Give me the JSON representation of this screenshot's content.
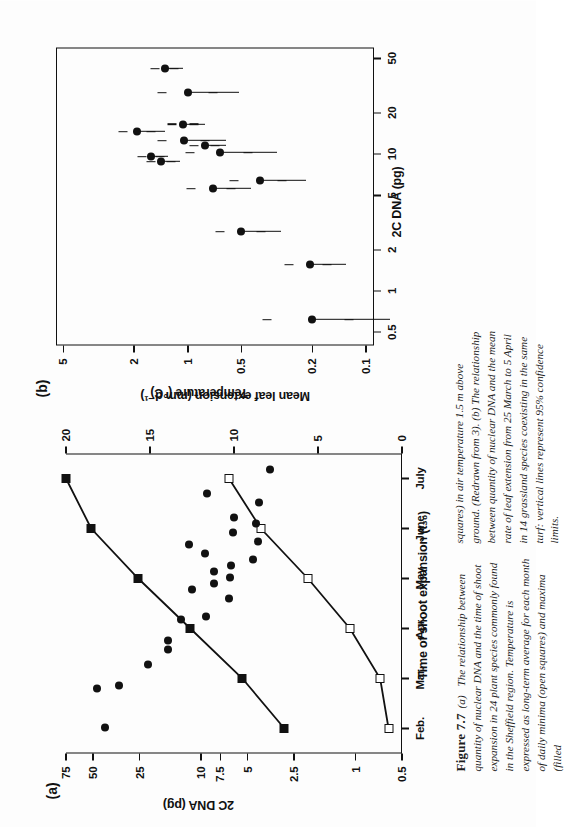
{
  "figure": {
    "label": "Figure 7.7",
    "caption_part_a_marker": "(a)",
    "caption_col1": "The relationship between quantity of nuclear DNA and the time of shoot expansion in 24 plant species commonly found in the Sheffield region. Temperature is expressed as long-term average for each month of daily minima (open squares) and maxima (filled",
    "caption_col2": "squares) in air temperature 1.5 m above ground. (Redrawn from 3). (b) The relationship between quantity of nuclear DNA and the mean rate of leaf extension from 25 March to 5 April in 14 grassland species coexisting in the same turf: vertical lines represent 95% confidence limits."
  },
  "panel_a": {
    "letter": "(a)",
    "left_axis_title": "2C DNA (pg)",
    "top_axis_title": "Temperature (°C)",
    "bottom_axis_title": "Time of shoot expansion (t₃₀)"
  },
  "panel_b": {
    "letter": "(b)",
    "left_axis_title": "Mean leaf extension (mm d⁻¹)",
    "bottom_axis_title": "2C DNA (pg)"
  },
  "chart_data": [
    {
      "id": "panel_a",
      "type": "scatter",
      "title": "(a) Nuclear DNA vs time of shoot expansion",
      "xlabel": "Time of shoot expansion (t30)",
      "ylabel": "2C DNA (pg)",
      "y2label": "Temperature (°C)",
      "yscale": "log",
      "ylim": [
        0.5,
        75
      ],
      "yticks": [
        75,
        50,
        25,
        10,
        7.5,
        5,
        2.5,
        1,
        0.5
      ],
      "ytick_labels": [
        "75",
        "50",
        "25",
        "10",
        "7.5",
        "5",
        "2.5",
        "1",
        "0.5"
      ],
      "y2lim": [
        0,
        20
      ],
      "y2ticks": [
        20,
        15,
        10,
        5,
        0
      ],
      "y2tick_labels": [
        "20",
        "15",
        "10",
        "5",
        "0"
      ],
      "xticks": [
        "Feb.",
        "Mar.",
        "Apr.",
        "May",
        "June",
        "July"
      ],
      "grid": false,
      "legend": "none",
      "series": [
        {
          "name": "maxima (filled squares)",
          "marker": "filled-square",
          "connected": true,
          "axis": "temperature",
          "points": [
            {
              "x": "Feb.",
              "temperature": 7.0
            },
            {
              "x": "Mar.",
              "temperature": 9.5
            },
            {
              "x": "Apr.",
              "temperature": 12.6
            },
            {
              "x": "May",
              "temperature": 15.7
            },
            {
              "x": "June",
              "temperature": 18.5
            },
            {
              "x": "July",
              "temperature": 20.0
            }
          ]
        },
        {
          "name": "minima (open squares)",
          "marker": "open-square",
          "connected": true,
          "axis": "temperature",
          "points": [
            {
              "x": "Feb.",
              "temperature": 0.8
            },
            {
              "x": "Mar.",
              "temperature": 1.3
            },
            {
              "x": "Apr.",
              "temperature": 3.1
            },
            {
              "x": "May",
              "temperature": 5.6
            },
            {
              "x": "June",
              "temperature": 8.4
            },
            {
              "x": "July",
              "temperature": 10.3
            }
          ]
        },
        {
          "name": "species 2C DNA",
          "marker": "filled-circle",
          "connected": false,
          "axis": "dna",
          "points": [
            {
              "x_frac": 0.085,
              "dna": 42
            },
            {
              "x_frac": 0.215,
              "dna": 47
            },
            {
              "x_frac": 0.225,
              "dna": 34
            },
            {
              "x_frac": 0.295,
              "dna": 22
            },
            {
              "x_frac": 0.345,
              "dna": 16.5
            },
            {
              "x_frac": 0.375,
              "dna": 16.5
            },
            {
              "x_frac": 0.445,
              "dna": 13.5
            },
            {
              "x_frac": 0.455,
              "dna": 9.3
            },
            {
              "x_frac": 0.515,
              "dna": 6.6
            },
            {
              "x_frac": 0.545,
              "dna": 11.5
            },
            {
              "x_frac": 0.565,
              "dna": 8.3
            },
            {
              "x_frac": 0.585,
              "dna": 6.5
            },
            {
              "x_frac": 0.605,
              "dna": 8.2
            },
            {
              "x_frac": 0.625,
              "dna": 6.4
            },
            {
              "x_frac": 0.645,
              "dna": 4.6
            },
            {
              "x_frac": 0.665,
              "dna": 9.4
            },
            {
              "x_frac": 0.695,
              "dna": 12.0
            },
            {
              "x_frac": 0.705,
              "dna": 4.3
            },
            {
              "x_frac": 0.735,
              "dna": 6.2
            },
            {
              "x_frac": 0.765,
              "dna": 4.4
            },
            {
              "x_frac": 0.785,
              "dna": 6.1
            },
            {
              "x_frac": 0.835,
              "dna": 4.2
            },
            {
              "x_frac": 0.865,
              "dna": 9.2
            },
            {
              "x_frac": 0.945,
              "dna": 3.6
            }
          ]
        }
      ]
    },
    {
      "id": "panel_b",
      "type": "scatter",
      "title": "(b) Mean leaf extension vs 2C DNA",
      "xlabel": "2C DNA (pg)",
      "ylabel": "Mean leaf extension (mm d-1)",
      "xscale": "log",
      "yscale": "log",
      "xlim": [
        0.4,
        60
      ],
      "xticks": [
        0.5,
        1,
        2,
        5,
        10,
        20,
        50
      ],
      "xtick_labels": [
        "0.5",
        "1",
        "2",
        "5",
        "10",
        "20",
        "50"
      ],
      "ylim": [
        0.09,
        5.5
      ],
      "yticks": [
        5,
        2,
        1,
        0.5,
        0.2,
        0.1
      ],
      "ytick_labels": [
        "5",
        "2",
        "1",
        "0.5",
        "0.2",
        "0.1"
      ],
      "grid": false,
      "legend": "none",
      "errorbar_note": "vertical lines represent 95% confidence limits",
      "points": [
        {
          "x": 0.62,
          "y": 0.2,
          "ylo": 0.125,
          "yhi": 0.36
        },
        {
          "x": 1.55,
          "y": 0.205,
          "ylo": 0.165,
          "yhi": 0.27
        },
        {
          "x": 2.7,
          "y": 0.5,
          "ylo": 0.39,
          "yhi": 0.66
        },
        {
          "x": 5.6,
          "y": 0.72,
          "ylo": 0.57,
          "yhi": 0.96
        },
        {
          "x": 6.4,
          "y": 0.395,
          "ylo": 0.295,
          "yhi": 0.55
        },
        {
          "x": 8.8,
          "y": 1.42,
          "ylo": 1.25,
          "yhi": 1.6
        },
        {
          "x": 9.6,
          "y": 1.62,
          "ylo": 1.44,
          "yhi": 1.8
        },
        {
          "x": 10.2,
          "y": 0.66,
          "ylo": 0.46,
          "yhi": 0.97
        },
        {
          "x": 11.5,
          "y": 0.8,
          "ylo": 0.7,
          "yhi": 0.92
        },
        {
          "x": 12.5,
          "y": 1.05,
          "ylo": 0.8,
          "yhi": 1.4
        },
        {
          "x": 14.5,
          "y": 1.93,
          "ylo": 1.6,
          "yhi": 2.3
        },
        {
          "x": 16.5,
          "y": 1.06,
          "ylo": 0.92,
          "yhi": 1.22
        },
        {
          "x": 28.0,
          "y": 1.0,
          "ylo": 0.72,
          "yhi": 1.4
        },
        {
          "x": 42.0,
          "y": 1.35,
          "ylo": 1.2,
          "yhi": 1.52
        }
      ]
    }
  ]
}
